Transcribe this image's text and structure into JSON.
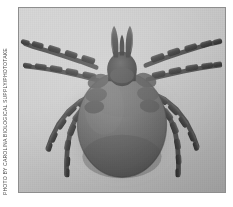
{
  "photo": {
    "caption_credit": "Photo by Carolina Biological Supply/Phototake",
    "subject": "tick",
    "view": "dorsal",
    "color_mode": "grayscale",
    "frame": {
      "border_color": "#8e8e8e",
      "background_color": "#c9c9c9",
      "page_background_color": "#ffffff"
    },
    "palette": {
      "photo_background_light": "#d2d2d2",
      "photo_background_mid": "#c2c2c2",
      "photo_background_shadow": "#aeaeae",
      "body_dark": "#5a5a5a",
      "body_mid": "#6d6d6d",
      "body_highlight": "#828282",
      "capitulum_dark": "#3a3a3a",
      "leg_segment_dark": "#3f3f3f",
      "leg_joint_light": "#c0c0c0"
    },
    "anatomy": {
      "idiosoma_label": "idiosoma",
      "capitulum_label": "capitulum",
      "palps_label": "palps",
      "legs_label": "legs",
      "leg_pair_count": 4,
      "total_leg_count": 8
    }
  }
}
